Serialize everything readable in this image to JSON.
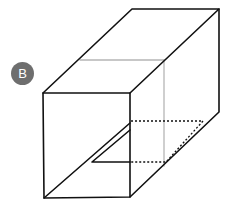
{
  "figure": {
    "label": "B",
    "badge_color": "#6e6e6e",
    "line_color": "#111111",
    "hidden_line_color": "#b5b5b5"
  }
}
